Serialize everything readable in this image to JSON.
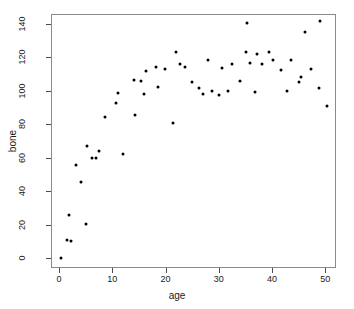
{
  "chart_data": {
    "type": "scatter",
    "title": "",
    "xlabel": "age",
    "ylabel": "bone",
    "xlim": [
      -1.5,
      52.0
    ],
    "ylim": [
      -6,
      146
    ],
    "grid": false,
    "legend": null,
    "xticks": [
      0,
      10,
      20,
      30,
      40,
      50
    ],
    "yticks": [
      0,
      20,
      40,
      60,
      80,
      100,
      120,
      140
    ],
    "marker": "filled-circle",
    "marker_color": "#000000",
    "n_points": 61,
    "points": [
      {
        "x": 0.2,
        "y": 0.3
      },
      {
        "x": 1.3,
        "y": 11.2
      },
      {
        "x": 1.6,
        "y": 26.5
      },
      {
        "x": 2.0,
        "y": 10.6
      },
      {
        "x": 3.0,
        "y": 56.3
      },
      {
        "x": 3.9,
        "y": 46.3
      },
      {
        "x": 4.8,
        "y": 20.8
      },
      {
        "x": 5.0,
        "y": 67.6
      },
      {
        "x": 6.1,
        "y": 60.2
      },
      {
        "x": 6.8,
        "y": 60.3
      },
      {
        "x": 7.4,
        "y": 64.6
      },
      {
        "x": 8.5,
        "y": 85.2
      },
      {
        "x": 10.6,
        "y": 93.6
      },
      {
        "x": 10.9,
        "y": 99.2
      },
      {
        "x": 11.8,
        "y": 62.6
      },
      {
        "x": 13.8,
        "y": 107.2
      },
      {
        "x": 14.1,
        "y": 86.1
      },
      {
        "x": 15.3,
        "y": 106.4
      },
      {
        "x": 15.7,
        "y": 98.7
      },
      {
        "x": 16.1,
        "y": 112.2
      },
      {
        "x": 18.1,
        "y": 115.0
      },
      {
        "x": 18.4,
        "y": 103.1
      },
      {
        "x": 19.8,
        "y": 113.4
      },
      {
        "x": 21.3,
        "y": 81.4
      },
      {
        "x": 21.8,
        "y": 123.8
      },
      {
        "x": 22.6,
        "y": 116.5
      },
      {
        "x": 23.4,
        "y": 115.0
      },
      {
        "x": 24.8,
        "y": 106.1
      },
      {
        "x": 26.1,
        "y": 102.5
      },
      {
        "x": 26.9,
        "y": 98.6
      },
      {
        "x": 27.8,
        "y": 119.0
      },
      {
        "x": 28.6,
        "y": 100.8
      },
      {
        "x": 29.8,
        "y": 97.9
      },
      {
        "x": 30.4,
        "y": 114.5
      },
      {
        "x": 31.6,
        "y": 100.4
      },
      {
        "x": 32.3,
        "y": 116.5
      },
      {
        "x": 33.8,
        "y": 106.8
      },
      {
        "x": 34.9,
        "y": 123.6
      },
      {
        "x": 35.1,
        "y": 141.3
      },
      {
        "x": 35.6,
        "y": 117.4
      },
      {
        "x": 36.6,
        "y": 99.8
      },
      {
        "x": 37.0,
        "y": 122.5
      },
      {
        "x": 37.9,
        "y": 116.6
      },
      {
        "x": 39.3,
        "y": 123.8
      },
      {
        "x": 39.9,
        "y": 119.3
      },
      {
        "x": 41.4,
        "y": 113.2
      },
      {
        "x": 42.6,
        "y": 100.7
      },
      {
        "x": 43.4,
        "y": 119.3
      },
      {
        "x": 44.8,
        "y": 106.1
      },
      {
        "x": 45.2,
        "y": 108.8
      },
      {
        "x": 45.9,
        "y": 136.0
      },
      {
        "x": 47.2,
        "y": 113.4
      },
      {
        "x": 48.6,
        "y": 102.5
      },
      {
        "x": 48.9,
        "y": 142.4
      },
      {
        "x": 50.2,
        "y": 91.8
      }
    ]
  }
}
